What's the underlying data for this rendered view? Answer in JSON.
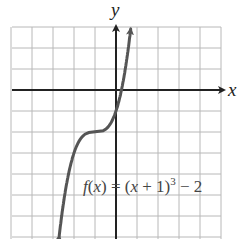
{
  "chart_data": {
    "type": "line",
    "title": "",
    "xlabel": "x",
    "ylabel": "y",
    "function_label": "f(x) = (x + 1)^3 − 2",
    "function_label_parts": {
      "f": "f",
      "x": "x",
      "eq": "=",
      "open": "(",
      "x2": "x",
      "plus": "+",
      "one": "1)",
      "exp": "3",
      "minus": "−",
      "two": "2"
    },
    "xlim": [
      -5,
      5
    ],
    "ylim": [
      -7,
      3
    ],
    "grid": true,
    "grid_step": 1,
    "series": [
      {
        "name": "f(x) = (x + 1)^3 − 2",
        "x": [
          -2.7,
          -2.5,
          -2,
          -1.5,
          -1,
          -0.5,
          0,
          0.25,
          0.44,
          0.8
        ],
        "y": [
          -6.91,
          -5.38,
          -3,
          -2.13,
          -2,
          -1.88,
          -1,
          0,
          1,
          3.83
        ]
      }
    ],
    "key_points": {
      "inflection": [
        -1,
        -2
      ],
      "y_intercept": [
        0,
        -1
      ],
      "x_intercept": [
        0.26,
        0
      ]
    },
    "arrows": [
      "both ends of curve",
      "positive x-axis",
      "positive y-axis"
    ]
  },
  "axes": {
    "x_label": "x",
    "y_label": "y"
  }
}
